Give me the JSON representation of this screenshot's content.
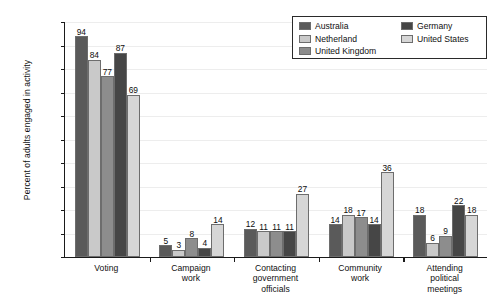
{
  "chart_data": {
    "type": "bar",
    "title": "",
    "xlabel": "",
    "ylabel": "Percent of adults engaged in activity",
    "ylim": [
      0,
      100
    ],
    "ytick_labels": [
      "0%",
      "10%",
      "20%",
      "30%",
      "40%",
      "50%",
      "60%",
      "70%",
      "80%",
      "90%",
      "100%"
    ],
    "ytick_values": [
      0,
      10,
      20,
      30,
      40,
      50,
      60,
      70,
      80,
      90,
      100
    ],
    "grid": true,
    "legend_position": "top-right",
    "categories": [
      "Voting",
      "Campaign work",
      "Contacting government officials",
      "Community work",
      "Attending political meetings"
    ],
    "category_lines": [
      [
        "Voting"
      ],
      [
        "Campaign",
        "work"
      ],
      [
        "Contacting",
        "government",
        "officials"
      ],
      [
        "Community",
        "work"
      ],
      [
        "Attending",
        "political",
        "meetings"
      ]
    ],
    "series": [
      {
        "name": "Australia",
        "color": "#5a5a5a",
        "values": [
          94,
          5,
          12,
          14,
          18
        ]
      },
      {
        "name": "Netherland",
        "color": "#c9c9c9",
        "values": [
          84,
          3,
          11,
          18,
          6
        ]
      },
      {
        "name": "United Kingdom",
        "color": "#8d8d8d",
        "values": [
          77,
          8,
          11,
          17,
          9
        ]
      },
      {
        "name": "Germany",
        "color": "#464646",
        "values": [
          87,
          4,
          11,
          14,
          22
        ]
      },
      {
        "name": "United States",
        "color": "#d6d6d6",
        "values": [
          69,
          14,
          27,
          36,
          18
        ]
      }
    ]
  },
  "legend": {
    "columns": [
      [
        "Australia",
        "Netherland",
        "United Kingdom"
      ],
      [
        "Germany",
        "United States"
      ]
    ]
  }
}
